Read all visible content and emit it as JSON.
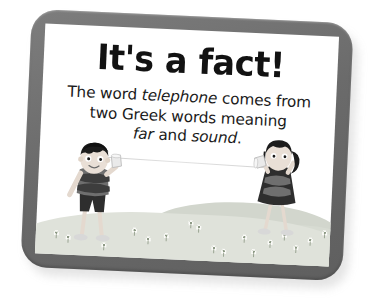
{
  "card": {
    "title": "It's a fact!",
    "body_lines": [
      {
        "segments": [
          {
            "text": "The word ",
            "italic": false
          },
          {
            "text": "telephone",
            "italic": true
          },
          {
            "text": " comes from",
            "italic": false
          }
        ]
      },
      {
        "segments": [
          {
            "text": "two Greek words meaning",
            "italic": false
          }
        ]
      },
      {
        "segments": [
          {
            "text": "far",
            "italic": true
          },
          {
            "text": " and ",
            "italic": false
          },
          {
            "text": "sound",
            "italic": true
          },
          {
            "text": ".",
            "italic": false
          }
        ]
      }
    ],
    "frame_color": "#6b6b6b",
    "page_color": "#ffffff",
    "title_color": "#121212",
    "body_color": "#1a1a1a"
  },
  "illustration": {
    "description": "Two children talking through a tin-can string telephone on a grassy field",
    "ground": {
      "near_color": "#dfe2da",
      "far_color": "#d2d6cd",
      "flower_color": "#fbfbf8"
    },
    "string": {
      "color": "#d4d4d4"
    },
    "boy": {
      "name": "boy-with-can",
      "hair_color": "#1c1c1c",
      "skin_color": "#e9dfd6",
      "shirt_color": "#6f6f6f",
      "shirt_stripe_color": "#3d3d3d",
      "shorts_color": "#2e2e2e",
      "can_color": "#e8e8e8"
    },
    "girl": {
      "name": "girl-with-can",
      "hair_color": "#1c1c1c",
      "skin_color": "#e9dfd6",
      "dress_color": "#2e2e2e",
      "dress_stripe_color": "#6f6f6f",
      "can_color": "#e8e8e8"
    },
    "flowers": [
      {
        "x": 18,
        "y": 88
      },
      {
        "x": 30,
        "y": 92
      },
      {
        "x": 66,
        "y": 98
      },
      {
        "x": 96,
        "y": 82
      },
      {
        "x": 110,
        "y": 90
      },
      {
        "x": 128,
        "y": 86
      },
      {
        "x": 152,
        "y": 72
      },
      {
        "x": 160,
        "y": 76
      },
      {
        "x": 176,
        "y": 96
      },
      {
        "x": 186,
        "y": 99
      },
      {
        "x": 206,
        "y": 84
      },
      {
        "x": 216,
        "y": 98
      },
      {
        "x": 232,
        "y": 88
      },
      {
        "x": 246,
        "y": 80
      },
      {
        "x": 258,
        "y": 92
      },
      {
        "x": 272,
        "y": 84
      },
      {
        "x": 286,
        "y": 76
      }
    ]
  }
}
